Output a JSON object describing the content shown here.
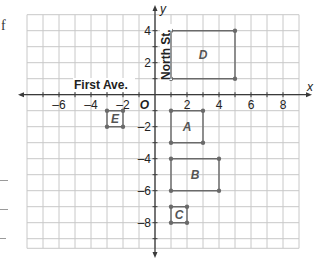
{
  "margin": {
    "fragment_text": "f",
    "lines": [
      180,
      209,
      238
    ]
  },
  "graph": {
    "origin_px": [
      155,
      94.7
    ],
    "unit_px": 16,
    "x_range": [
      -8,
      9
    ],
    "y_range": [
      -9.6,
      5
    ],
    "x_axis_label": "x",
    "y_axis_label": "y",
    "origin_label": "O",
    "x_ticks": [
      {
        "value": -6,
        "label": "–6"
      },
      {
        "value": -4,
        "label": "–4"
      },
      {
        "value": -2,
        "label": "–2"
      },
      {
        "value": 2,
        "label": "2"
      },
      {
        "value": 4,
        "label": "4"
      },
      {
        "value": 6,
        "label": "6"
      },
      {
        "value": 8,
        "label": "8"
      }
    ],
    "y_ticks": [
      {
        "value": 4,
        "label": "4"
      },
      {
        "value": 2,
        "label": "2"
      },
      {
        "value": -2,
        "label": "–2"
      },
      {
        "value": -4,
        "label": "–4"
      },
      {
        "value": -6,
        "label": "–6"
      },
      {
        "value": -8,
        "label": "–8"
      }
    ],
    "street_labels": {
      "horizontal": "First Ave.",
      "vertical": "North St."
    },
    "colors": {
      "grid": "#c8c8c8",
      "axis": "#3a3a3a",
      "rect": "#6a6a6a",
      "text": "#222222",
      "rect_label": "#555555"
    }
  },
  "chart_data": {
    "type": "scatter",
    "title": "",
    "xlabel": "x",
    "ylabel": "y",
    "xlim": [
      -8,
      9
    ],
    "ylim": [
      -9.5,
      5
    ],
    "grid": true,
    "annotations": [
      "First Ave.",
      "North St.",
      "O"
    ],
    "rectangles": [
      {
        "name": "D",
        "vertices": [
          [
            1,
            1
          ],
          [
            5,
            1
          ],
          [
            5,
            4
          ],
          [
            1,
            4
          ]
        ]
      },
      {
        "name": "A",
        "vertices": [
          [
            1,
            -1
          ],
          [
            3,
            -1
          ],
          [
            3,
            -3
          ],
          [
            1,
            -3
          ]
        ]
      },
      {
        "name": "B",
        "vertices": [
          [
            1,
            -4
          ],
          [
            4,
            -4
          ],
          [
            4,
            -6
          ],
          [
            1,
            -6
          ]
        ]
      },
      {
        "name": "C",
        "vertices": [
          [
            1,
            -7
          ],
          [
            2,
            -7
          ],
          [
            2,
            -8
          ],
          [
            1,
            -8
          ]
        ]
      },
      {
        "name": "E",
        "vertices": [
          [
            -3,
            -1
          ],
          [
            -2,
            -1
          ],
          [
            -2,
            -2
          ],
          [
            -3,
            -2
          ]
        ]
      }
    ]
  }
}
